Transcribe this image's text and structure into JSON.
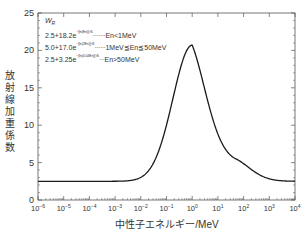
{
  "chart_data": {
    "type": "line",
    "title": "",
    "xlabel": "中性子エネルギー/MeV",
    "ylabel": "放射線加重係数",
    "xscale": "log",
    "xlim": [
      1e-06,
      10000.0
    ],
    "ylim": [
      0,
      25
    ],
    "x_ticks": [
      "10⁻⁶",
      "10⁻⁵",
      "10⁻⁴",
      "10⁻³",
      "10⁻²",
      "10⁻¹",
      "10⁰",
      "10¹",
      "10²",
      "10³",
      "10⁴"
    ],
    "y_ticks": [
      "0",
      "5",
      "10",
      "15",
      "20",
      "25"
    ],
    "grid": false,
    "legend": {
      "title": "W_R",
      "entries": [
        {
          "formula": "2.5+18.2e",
          "exponent": "−[ln(En)]²/6",
          "condition": "En<1MeV"
        },
        {
          "formula": "5.0+17.0e",
          "exponent": "−[ln(2En)]²/6",
          "condition": "1MeV≦En≦50MeV"
        },
        {
          "formula": "2.5+3.25e",
          "exponent": "−[ln(0.04En)]²/6",
          "condition": "En>50MeV"
        }
      ]
    },
    "series": [
      {
        "name": "W_R",
        "x": [
          1e-06,
          1e-05,
          0.0001,
          0.001,
          0.003,
          0.01,
          0.03,
          0.1,
          0.2,
          0.5,
          1,
          2,
          5,
          10,
          20,
          50,
          100,
          200,
          500,
          1000,
          3000,
          10000
        ],
        "values": [
          2.5,
          2.5,
          2.5,
          2.56,
          2.7,
          3.22,
          4.5,
          7.1,
          9.4,
          13.9,
          20.7,
          16.7,
          10.3,
          7.4,
          6.1,
          5.5,
          4.9,
          3.9,
          3.0,
          2.7,
          2.55,
          2.5
        ]
      }
    ]
  },
  "axes": {
    "ylabel_chars": [
      "放",
      "射",
      "線",
      "加",
      "重",
      "係",
      "数"
    ],
    "xlabel": "中性子エネルギー/MeV"
  },
  "legend": {
    "title": "W",
    "title_sub": "R",
    "rows": [
      {
        "base": "2.5+18.2e",
        "exp": "−[ln(En)]²/6",
        "dots": "·······",
        "cond": "En<1MeV"
      },
      {
        "base": "5.0+17.0e",
        "exp": "−[ln(2En)]²/6",
        "dots": "······",
        "cond": "1MeV≦En≦50MeV"
      },
      {
        "base": "2.5+3.25e",
        "exp": "−[ln(0.04En)]²/6",
        "dots": "···",
        "cond": "En>50MeV"
      }
    ]
  },
  "colors": {
    "line": "#1a1a1a",
    "axis": "#555555"
  }
}
